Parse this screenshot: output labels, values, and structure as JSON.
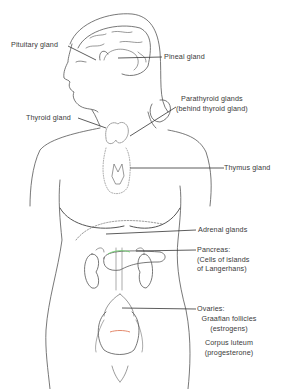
{
  "diagram": {
    "colors": {
      "line": "#555555",
      "text": "#3a3a3a",
      "pancreas_accent": "#6fcf6f",
      "ovary_accent": "#e07a5a",
      "background": "#ffffff"
    },
    "labels": {
      "pituitary": "Pituitary gland",
      "pineal": "Pineal gland",
      "parathyroid_line1": "Parathyroid glands",
      "parathyroid_line2": "(behind thyroid gland)",
      "thyroid": "Thyroid gland",
      "thymus": "Thymus gland",
      "adrenal": "Adrenal glands",
      "pancreas_line1": "Pancreas:",
      "pancreas_line2": "(Cells of islands",
      "pancreas_line3": "of Langerhans)",
      "ovaries": "Ovaries:",
      "graafian_line1": "Graafian follicles",
      "graafian_line2": "(estrogens)",
      "corpus_line1": "Corpus luteum",
      "corpus_line2": "(progesterone)"
    }
  }
}
